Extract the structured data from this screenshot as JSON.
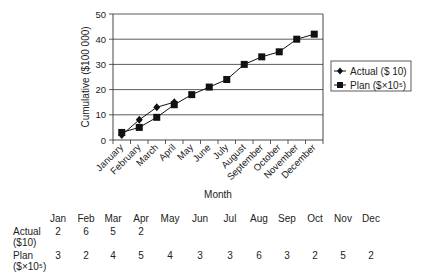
{
  "chart_data": {
    "type": "line",
    "title": "",
    "xlabel": "Month",
    "ylabel": "Cumulative ($100 000)",
    "ylim": [
      0,
      50
    ],
    "yticks": [
      0,
      10,
      20,
      30,
      40,
      50
    ],
    "grid": true,
    "legend_position": "right",
    "categories": [
      "January",
      "February",
      "March",
      "April",
      "May",
      "June",
      "July",
      "August",
      "September",
      "October",
      "November",
      "December"
    ],
    "series": [
      {
        "name": "Actual ($ 10)",
        "marker": "diamond",
        "values": [
          2,
          8,
          13,
          15,
          null,
          null,
          null,
          null,
          null,
          null,
          null,
          null
        ]
      },
      {
        "name": "Plan ($×10⁵)",
        "marker": "square",
        "values": [
          3,
          5,
          9,
          14,
          18,
          21,
          24,
          30,
          33,
          35,
          40,
          42
        ]
      }
    ]
  },
  "table": {
    "header_title": "Month",
    "columns": [
      "Jan",
      "Feb",
      "Mar",
      "Apr",
      "May",
      "Jun",
      "Jul",
      "Aug",
      "Sep",
      "Oct",
      "Nov",
      "Dec"
    ],
    "rows": [
      {
        "label_line1": "Actual",
        "label_line2": "($10)",
        "values": [
          "2",
          "6",
          "5",
          "2",
          "",
          "",
          "",
          "",
          "",
          "",
          "",
          ""
        ]
      },
      {
        "label_line1": "Plan",
        "label_line2": "($×10⁵)",
        "values": [
          "3",
          "2",
          "4",
          "5",
          "4",
          "3",
          "3",
          "6",
          "3",
          "2",
          "5",
          "2"
        ]
      }
    ]
  }
}
